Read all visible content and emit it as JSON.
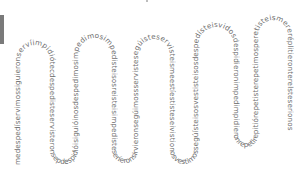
{
  "canvas": {
    "width": 298,
    "height": 174,
    "background": "#ffffff"
  },
  "colors": {
    "text": "#6e6e6e",
    "side_bar": "#7a7a7a"
  },
  "serpentine_text": "medespedíservimossiguieronservíimpidióteсdespedisteservisteronseрdespidióisiguióinosdespedimosimpedimosimpedisteisosreisteisimpedisteseríeronsirvieronsegúimossservistesegúisteservisteismeestíestisteseivistionosvestimossegúísteisosvestisteisosdespedísteisvidosdespidieronimpedimpidieronrepetirepitiórepetisterepetimosperetisteismereréplitieronterelsteserionosreimossegúi",
  "arches": 7
}
